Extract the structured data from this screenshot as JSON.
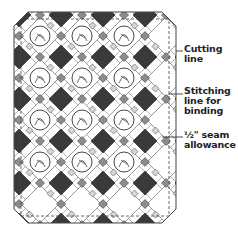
{
  "diagram": {
    "medallion_grid": {
      "columns": 3,
      "rows": 4
    },
    "colors": {
      "dark_square": "#3a3a3a",
      "gray_square": "#8c8c8c",
      "light_square": "#d6d6d6",
      "background": "#ffffff",
      "line": "#444444"
    },
    "labels": [
      {
        "id": "cutting",
        "text": "Cutting\nline",
        "y": 44
      },
      {
        "id": "stitching",
        "text": "Stitching\nline for\nbinding",
        "y": 86
      },
      {
        "id": "seam",
        "text": "½\" seam\nallowance",
        "y": 130
      }
    ]
  }
}
